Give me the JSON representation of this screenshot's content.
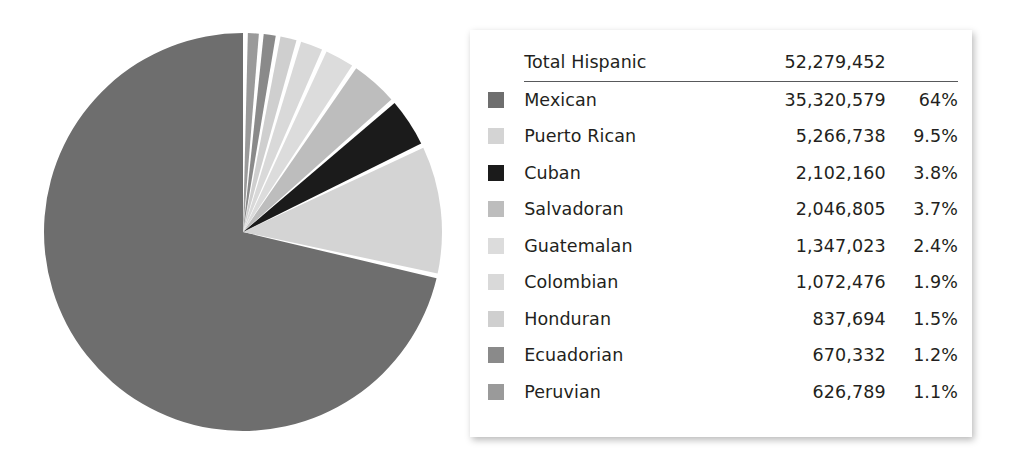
{
  "chart_data": {
    "type": "pie",
    "title": "",
    "total_label": "Total Hispanic",
    "total_value": "52,279,452",
    "categories": [
      "Mexican",
      "Puerto Rican",
      "Cuban",
      "Salvadoran",
      "Guatemalan",
      "Colombian",
      "Honduran",
      "Ecuadorian",
      "Peruvian"
    ],
    "values": [
      35320579,
      5266738,
      2102160,
      2046805,
      1347023,
      1072476,
      837694,
      670332,
      626789
    ],
    "percents": [
      64,
      9.5,
      3.8,
      3.7,
      2.4,
      1.9,
      1.5,
      1.2,
      1.1
    ],
    "colors": [
      "#6e6e6e",
      "#d4d4d4",
      "#1b1b1b",
      "#bdbdbd",
      "#dcdcdc",
      "#d9d9d9",
      "#cfcfcf",
      "#8a8a8a",
      "#9a9a9a"
    ],
    "legend_position": "right",
    "grid": false,
    "slice_gap_degrees": 1.4,
    "start_angle_degrees": 0,
    "direction": "counterclockwise"
  },
  "legend": {
    "total": {
      "label": "Total Hispanic",
      "value": "52,279,452",
      "percent": ""
    },
    "rows": [
      {
        "label": "Mexican",
        "value": "35,320,579",
        "percent": "64%",
        "color": "#6e6e6e"
      },
      {
        "label": "Puerto Rican",
        "value": "5,266,738",
        "percent": "9.5%",
        "color": "#d4d4d4"
      },
      {
        "label": "Cuban",
        "value": "2,102,160",
        "percent": "3.8%",
        "color": "#1b1b1b"
      },
      {
        "label": "Salvadoran",
        "value": "2,046,805",
        "percent": "3.7%",
        "color": "#bdbdbd"
      },
      {
        "label": "Guatemalan",
        "value": "1,347,023",
        "percent": "2.4%",
        "color": "#dcdcdc"
      },
      {
        "label": "Colombian",
        "value": "1,072,476",
        "percent": "1.9%",
        "color": "#d9d9d9"
      },
      {
        "label": "Honduran",
        "value": "837,694",
        "percent": "1.5%",
        "color": "#cfcfcf"
      },
      {
        "label": "Ecuadorian",
        "value": "670,332",
        "percent": "1.2%",
        "color": "#8a8a8a"
      },
      {
        "label": "Peruvian",
        "value": "626,789",
        "percent": "1.1%",
        "color": "#9a9a9a"
      }
    ]
  }
}
